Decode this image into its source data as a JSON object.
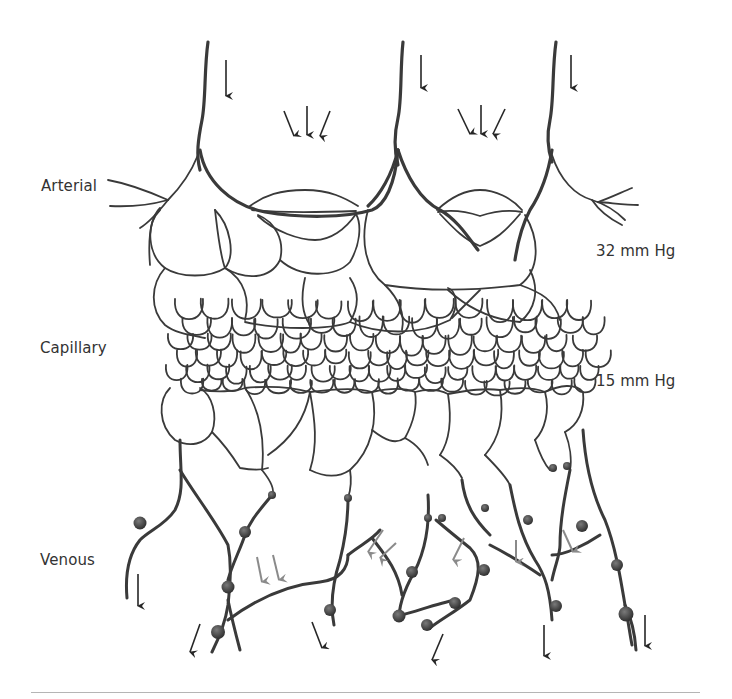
{
  "figure": {
    "labels": {
      "arterial": "Arterial",
      "capillary": "Capillary",
      "venous": "Venous",
      "pressure_high": "32 mm Hg",
      "pressure_low": "15 mm Hg"
    },
    "regions": [
      {
        "name": "arterial",
        "label": "Arterial",
        "y_range": [
          30,
          250
        ]
      },
      {
        "name": "capillary",
        "label": "Capillary",
        "y_range": [
          250,
          400
        ]
      },
      {
        "name": "venous",
        "label": "Venous",
        "y_range": [
          400,
          660
        ]
      }
    ],
    "pressures": [
      {
        "label": "32 mm Hg",
        "position": "arterial end of capillary bed"
      },
      {
        "label": "15 mm Hg",
        "position": "venous end of capillary bed"
      }
    ],
    "arrows": {
      "inflow_arteries": 3,
      "precapillary_sphincter_groups": 2,
      "arrows_per_sphincter_group": 3,
      "venous_outflow_dark": 7,
      "venous_gray_flow": 7
    },
    "colors": {
      "vessel": "#3a3a3a",
      "label": "#333333",
      "gray_arrow": "#8a8a8a",
      "divider": "#b5b5b5",
      "background": "#ffffff"
    }
  }
}
